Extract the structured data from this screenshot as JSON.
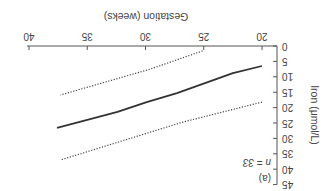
{
  "chart_data": {
    "type": "line",
    "title": "",
    "panel_label": "(a)",
    "annotation": "n = 33",
    "xlabel": "Gestation (weeks)",
    "ylabel": "Iron (μmol/L)",
    "xlim": [
      20,
      40
    ],
    "ylim": [
      0,
      45
    ],
    "xticks": [
      20,
      25,
      30,
      35,
      40
    ],
    "yticks": [
      0,
      5,
      10,
      15,
      20,
      25,
      30,
      35,
      40,
      45
    ],
    "grid": false,
    "legend": null,
    "orientation_note": "figure rendered rotated 180 degrees",
    "series": [
      {
        "name": "mean",
        "style": "solid",
        "color": "#333333",
        "x": [
          20,
          22.5,
          27.3,
          29.9,
          32.4,
          37.6
        ],
        "y": [
          6.5,
          8.8,
          15.3,
          18.2,
          21.4,
          26.6
        ]
      },
      {
        "name": "lower bound",
        "style": "dotted",
        "color": "#444444",
        "x": [
          25.1,
          29.6,
          37.3
        ],
        "y": [
          1.6,
          7.5,
          15.9
        ]
      },
      {
        "name": "upper bound",
        "style": "dotted",
        "color": "#444444",
        "x": [
          20,
          26.8,
          37.3
        ],
        "y": [
          18.2,
          24.7,
          37.0
        ]
      }
    ]
  }
}
